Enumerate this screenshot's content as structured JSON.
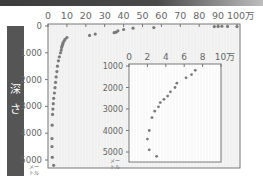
{
  "chart_data": [
    {
      "id": "main",
      "type": "scatter",
      "title": "",
      "xlabel": "",
      "ylabel": "深さ",
      "y_unit": "メートル",
      "x_unit_suffix": "万",
      "xlim": [
        0,
        100
      ],
      "ylim": [
        5200,
        0
      ],
      "x_ticks": [
        "0",
        "10",
        "20",
        "30",
        "40",
        "50",
        "60",
        "70",
        "80",
        "90",
        "100万"
      ],
      "y_ticks": [
        "0",
        "1000",
        "2000",
        "3000",
        "4000",
        "5000"
      ],
      "grid": true,
      "series": [
        {
          "name": "main",
          "points": [
            [
              100,
              20
            ],
            [
              95,
              15
            ],
            [
              92,
              10
            ],
            [
              90,
              15
            ],
            [
              88,
              20
            ],
            [
              56,
              60
            ],
            [
              45,
              80
            ],
            [
              40,
              130
            ],
            [
              37,
              180
            ],
            [
              36,
              230
            ],
            [
              35,
              250
            ],
            [
              25,
              300
            ],
            [
              22,
              350
            ],
            [
              10,
              430
            ],
            [
              9,
              500
            ],
            [
              8.5,
              560
            ],
            [
              8,
              620
            ],
            [
              7.8,
              680
            ],
            [
              7.5,
              740
            ],
            [
              7.2,
              800
            ],
            [
              7,
              900
            ],
            [
              6.6,
              1000
            ],
            [
              6,
              1150
            ],
            [
              5.5,
              1300
            ],
            [
              5,
              1500
            ],
            [
              4.7,
              1700
            ],
            [
              4.3,
              1900
            ],
            [
              4,
              2100
            ],
            [
              3.7,
              2300
            ],
            [
              3.4,
              2500
            ],
            [
              3,
              2700
            ],
            [
              2.8,
              2900
            ],
            [
              2.6,
              3100
            ],
            [
              2.4,
              3300
            ],
            [
              2.2,
              3700
            ],
            [
              2.1,
              4200
            ],
            [
              2.1,
              4500
            ],
            [
              2.3,
              4900
            ],
            [
              3,
              5200
            ]
          ]
        }
      ]
    },
    {
      "id": "inset",
      "type": "scatter",
      "title": "",
      "xlabel": "",
      "ylabel": "",
      "y_unit": "メートル",
      "x_unit_suffix": "万",
      "xlim": [
        0,
        10
      ],
      "ylim": [
        5300,
        1000
      ],
      "x_ticks": [
        "0",
        "2",
        "4",
        "6",
        "8",
        "10万"
      ],
      "y_ticks": [
        "1000",
        "2000",
        "3000",
        "4000",
        "5000"
      ],
      "grid": true,
      "series": [
        {
          "name": "inset",
          "points": [
            [
              7.2,
              1200
            ],
            [
              6.8,
              1400
            ],
            [
              6.2,
              1550
            ],
            [
              5.2,
              1800
            ],
            [
              5.0,
              2000
            ],
            [
              4.5,
              2200
            ],
            [
              4.2,
              2400
            ],
            [
              3.8,
              2550
            ],
            [
              3.4,
              2700
            ],
            [
              3.2,
              2900
            ],
            [
              2.8,
              3100
            ],
            [
              2.5,
              3400
            ],
            [
              2.2,
              4000
            ],
            [
              2.0,
              4400
            ],
            [
              2.2,
              4900
            ],
            [
              3.0,
              5200
            ]
          ]
        }
      ]
    }
  ],
  "labels": {
    "depth_char_1": "深",
    "depth_char_2": "さ",
    "unit_line_1": "メー",
    "unit_line_2": "トル"
  },
  "colors": {
    "bar": "#555555",
    "points": "#7a7a7a",
    "plot_bg": "#f4f4f4",
    "axis": "#777777",
    "grid": "#e6e6e6"
  }
}
